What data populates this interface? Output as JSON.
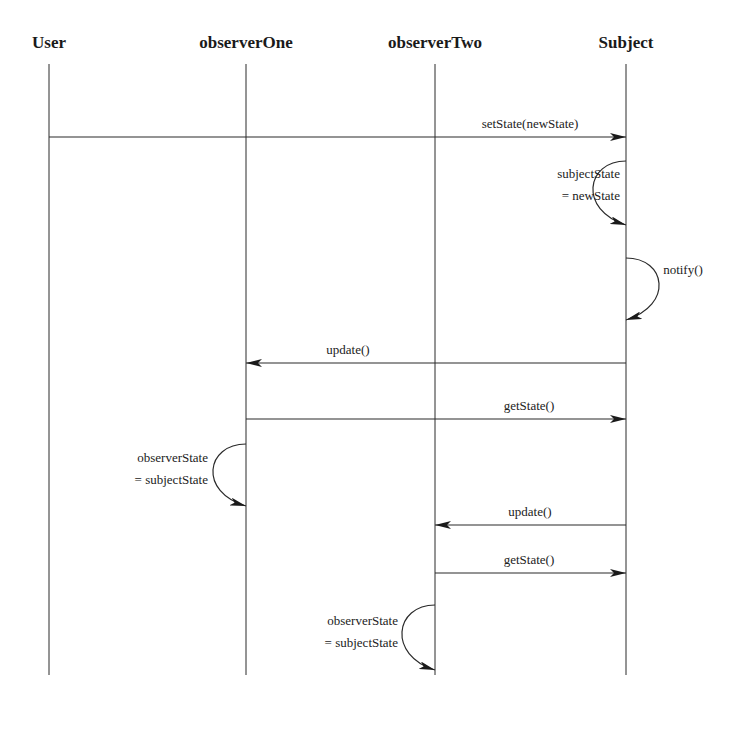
{
  "diagram": {
    "type": "sequence",
    "actors": [
      {
        "id": "user",
        "label": "User",
        "x": 49
      },
      {
        "id": "observerOne",
        "label": "observerOne",
        "x": 246
      },
      {
        "id": "observerTwo",
        "label": "observerTwo",
        "x": 435
      },
      {
        "id": "subject",
        "label": "Subject",
        "x": 626
      }
    ],
    "messages": [
      {
        "from": "user",
        "to": "subject",
        "label": "setState(newState)",
        "y": 137
      },
      {
        "self": "subject",
        "label_lines": [
          "subjectState",
          "= newState"
        ],
        "side": "left",
        "y1": 161,
        "y2": 225
      },
      {
        "self": "subject",
        "label_lines": [
          "notify()"
        ],
        "side": "right",
        "y1": 258,
        "y2": 320
      },
      {
        "from": "subject",
        "to": "observerOne",
        "label": "update()",
        "y": 363
      },
      {
        "from": "observerOne",
        "to": "subject",
        "label": "getState()",
        "y": 419
      },
      {
        "self": "observerOne",
        "label_lines": [
          "observerState",
          "= subjectState"
        ],
        "side": "left",
        "y1": 444,
        "y2": 506
      },
      {
        "from": "subject",
        "to": "observerTwo",
        "label": "update()",
        "y": 525
      },
      {
        "from": "observerTwo",
        "to": "subject",
        "label": "getState()",
        "y": 573
      },
      {
        "self": "observerTwo",
        "label_lines": [
          "observerState",
          "= subjectState"
        ],
        "side": "left",
        "y1": 605,
        "y2": 670
      }
    ]
  },
  "labels": {
    "actor_user": "User",
    "actor_observer_one": "observerOne",
    "actor_observer_two": "observerTwo",
    "actor_subject": "Subject",
    "msg_set_state": "setState(newState)",
    "note_subject_state_1": "subjectState",
    "note_subject_state_2": "= newState",
    "msg_notify": "notify()",
    "msg_update_one": "update()",
    "msg_get_state_one": "getState()",
    "note_observer_one_1": "observerState",
    "note_observer_one_2": "= subjectState",
    "msg_update_two": "update()",
    "msg_get_state_two": "getState()",
    "note_observer_two_1": "observerState",
    "note_observer_two_2": "= subjectState"
  },
  "colors": {
    "line": "#2a2a2a",
    "background": "#ffffff"
  }
}
